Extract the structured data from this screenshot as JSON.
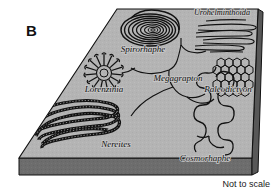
{
  "figure": {
    "panel_letter": "B",
    "caption": "Not to scale",
    "colors": {
      "slab_top": "#b4b4b4",
      "slab_front": "#6d6d6d",
      "slab_side": "#585858",
      "outline": "#111111",
      "trace_ink": "#121212",
      "background": "#ffffff"
    }
  },
  "traces": [
    {
      "id": "spirorhaphe",
      "label": "Spirorhaphe",
      "morphology": "tight concentric spiral burrow",
      "label_x": 143,
      "label_y": 52
    },
    {
      "id": "urohelminthoida",
      "label": "Urohelminthoida",
      "morphology": "elongate parallel hairpin meanders",
      "label_x": 245,
      "label_y": 15
    },
    {
      "id": "lorenzinia",
      "label": "Lorenzinia",
      "morphology": "radial starburst rosette of short rays",
      "label_x": 103,
      "label_y": 91
    },
    {
      "id": "megagrapton",
      "label": "Megagrapton",
      "morphology": "irregular branching anastomosing network",
      "label_x": 178,
      "label_y": 81
    },
    {
      "id": "paleodictyon",
      "label": "Paleodictyon",
      "morphology": "regular hexagonal honeycomb mesh",
      "label_x": 228,
      "label_y": 92
    },
    {
      "id": "nereites",
      "label": "Nereites",
      "morphology": "broad textured meandering band",
      "label_x": 115,
      "label_y": 146
    },
    {
      "id": "cosmorhaphe",
      "label": "Cosmorhaphe",
      "morphology": "second-order meandering string",
      "label_x": 205,
      "label_y": 161
    }
  ]
}
